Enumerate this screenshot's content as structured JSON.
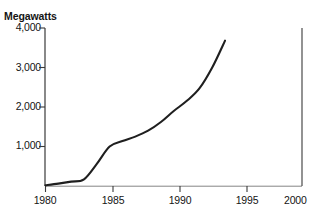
{
  "figure": {
    "clipped_title_fragment": "",
    "y_axis_title": "Megawatts",
    "background_color": "#ffffff",
    "line_color": "#1f1f1f",
    "axis_color": "#3a3a3a"
  },
  "chart_data": {
    "type": "line",
    "title": "",
    "xlabel": "",
    "ylabel": "Megawatts",
    "xlim": [
      1980,
      2000
    ],
    "ylim": [
      0,
      4000
    ],
    "grid": false,
    "legend": null,
    "x_ticks": [
      1980,
      1985,
      1990,
      1995,
      2000
    ],
    "x_tick_labels": [
      "1980",
      "1985",
      "1990",
      "1995",
      "2000"
    ],
    "y_ticks": [
      1000,
      2000,
      3000,
      4000
    ],
    "y_tick_labels": [
      "1,000",
      "2,000",
      "3,000",
      "4,000"
    ],
    "series": [
      {
        "name": "Installed capacity",
        "x": [
          1980,
          1981,
          1982,
          1983,
          1984,
          1985,
          1986,
          1987,
          1988,
          1989,
          1990,
          1991,
          1992,
          1993,
          1994
        ],
        "values": [
          20,
          60,
          110,
          170,
          560,
          1000,
          1140,
          1250,
          1400,
          1620,
          1900,
          2150,
          2470,
          3000,
          3680
        ]
      }
    ]
  }
}
